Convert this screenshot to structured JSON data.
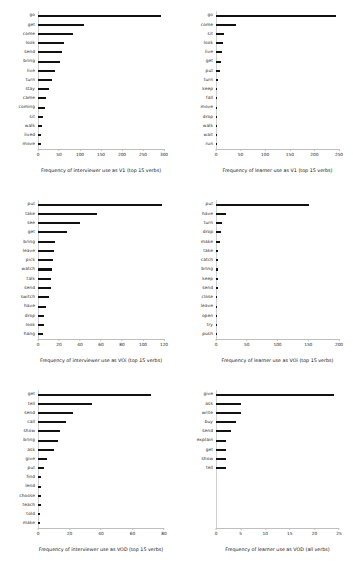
{
  "figure": {
    "title": "",
    "background": "#ffffff",
    "bar_color": "#111111",
    "panel_count": 6
  },
  "chart_data": [
    {
      "type": "bar",
      "orientation": "horizontal",
      "title": "Frequency of interviewer use as V1 (top 15 verbs)",
      "xlabel": "Frequency of interviewer use as V1 (top 15 verbs)",
      "ylabel": "",
      "xlim": [
        0,
        300
      ],
      "ticks": [
        0,
        50,
        100,
        150,
        200,
        250,
        300
      ],
      "grid": false,
      "legend": "none",
      "categories": [
        "go",
        "get",
        "come",
        "look",
        "send",
        "bring",
        "live",
        "turn",
        "stay",
        "came",
        "coming",
        "sit",
        "walk",
        "lived",
        "move"
      ],
      "values": [
        292,
        110,
        84,
        62,
        58,
        52,
        40,
        34,
        26,
        20,
        17,
        12,
        9,
        8,
        6
      ]
    },
    {
      "type": "bar",
      "orientation": "horizontal",
      "title": "Frequency of learner use as V1 (top 15 verbs)",
      "xlabel": "Frequency of learner use as V1 (top 15 verbs)",
      "ylabel": "",
      "xlim": [
        0,
        250
      ],
      "ticks": [
        0,
        50,
        100,
        150,
        200,
        250
      ],
      "grid": false,
      "legend": "none",
      "categories": [
        "go",
        "come",
        "sit",
        "look",
        "live",
        "get",
        "put",
        "turn",
        "keep",
        "fall",
        "move",
        "drop",
        "walk",
        "wait",
        "run"
      ],
      "values": [
        243,
        40,
        16,
        14,
        12,
        11,
        8,
        4,
        3,
        2,
        2,
        2,
        1,
        1,
        1
      ]
    },
    {
      "type": "bar",
      "orientation": "horizontal",
      "title": "Frequency of interviewer use as VOi (top 15 verbs)",
      "xlabel": "Frequency of interviewer use as VOi (top 15 verbs)",
      "ylabel": "",
      "xlim": [
        0,
        120
      ],
      "ticks": [
        0,
        20,
        40,
        60,
        80,
        100,
        120
      ],
      "grid": false,
      "legend": "none",
      "categories": [
        "put",
        "take",
        "see",
        "get",
        "bring",
        "leave",
        "pick",
        "watch",
        "talk",
        "send",
        "switch",
        "have",
        "drop",
        "look",
        "hang"
      ],
      "values": [
        118,
        56,
        40,
        28,
        16,
        15,
        14,
        13,
        12,
        12,
        10,
        8,
        6,
        6,
        5
      ]
    },
    {
      "type": "bar",
      "orientation": "horizontal",
      "title": "Frequency of learner use as VOi (top 15 verbs)",
      "xlabel": "Frequency of learner use as VOi (top 15 verbs)",
      "ylabel": "",
      "xlim": [
        0,
        200
      ],
      "ticks": [
        0,
        50,
        100,
        150,
        200
      ],
      "grid": false,
      "legend": "none",
      "categories": [
        "put",
        "have",
        "turn",
        "drop",
        "make",
        "take",
        "catch",
        "bring",
        "keep",
        "send",
        "close",
        "leave",
        "open",
        "try",
        "push"
      ],
      "values": [
        152,
        16,
        9,
        8,
        7,
        4,
        4,
        3,
        3,
        3,
        2,
        2,
        2,
        1,
        1
      ]
    },
    {
      "type": "bar",
      "orientation": "horizontal",
      "title": "Frequency of interviewer use as VOD (top 15 verbs)",
      "xlabel": "Frequency of interviewer use as VOD (top 15 verbs)",
      "ylabel": "",
      "xlim": [
        0,
        80
      ],
      "ticks": [
        0,
        20,
        40,
        60,
        80
      ],
      "grid": false,
      "legend": "none",
      "categories": [
        "get",
        "tell",
        "send",
        "call",
        "show",
        "bring",
        "ask",
        "give",
        "put",
        "find",
        "lend",
        "choose",
        "teach",
        "told",
        "make"
      ],
      "values": [
        72,
        34,
        22,
        18,
        14,
        13,
        10,
        6,
        4,
        2,
        2,
        2,
        2,
        1,
        1
      ]
    },
    {
      "type": "bar",
      "orientation": "horizontal",
      "title": "Frequency of learner use as VOD (all verbs)",
      "xlabel": "Frequency of learner use as VOD (all verbs)",
      "ylabel": "",
      "xlim": [
        0,
        25
      ],
      "ticks": [
        0,
        5,
        10,
        15,
        20,
        25
      ],
      "grid": false,
      "legend": "none",
      "categories": [
        "give",
        "ask",
        "write",
        "buy",
        "send",
        "explain",
        "get",
        "show",
        "tell"
      ],
      "values": [
        24,
        5,
        5,
        4,
        3,
        2,
        2,
        2,
        2
      ]
    }
  ]
}
